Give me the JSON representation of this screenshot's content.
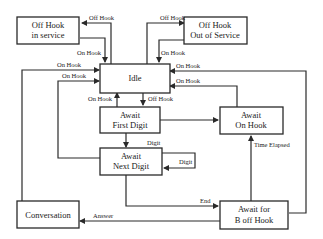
{
  "diagram": {
    "type": "state-machine",
    "states": {
      "off_hook_in_service": {
        "line1": "Off Hook",
        "line2": "in service"
      },
      "off_hook_out_of_service": {
        "line1": "Off Hook",
        "line2": "Out of Service"
      },
      "idle": {
        "line1": "Idle"
      },
      "await_first_digit": {
        "line1": "Await",
        "line2": "First Digit"
      },
      "await_on_hook": {
        "line1": "Await",
        "line2": "On Hook"
      },
      "await_next_digit": {
        "line1": "Await",
        "line2": "Next Digit"
      },
      "conversation": {
        "line1": "Conversation"
      },
      "await_b_off_hook": {
        "line1": "Await for",
        "line2": "B off Hook"
      }
    },
    "transitions": {
      "idle_to_in_service": "Off Hook",
      "in_service_to_idle": "On Hook",
      "idle_to_out_of_service": "Off Hook",
      "out_of_service_to_idle": "On Hook",
      "conversation_to_idle": "On Hook",
      "next_digit_to_idle": "On Hook",
      "b_off_hook_to_idle": "On Hook",
      "await_on_hook_to_idle": "On Hook",
      "first_digit_to_idle": "On Hook",
      "idle_to_first_digit": "Off Hook",
      "first_digit_to_next_digit": "Digit",
      "next_digit_self": "Digit",
      "b_off_hook_to_await_on_hook": "Time Elapsed",
      "next_digit_to_b_off_hook": "End",
      "b_off_hook_to_conversation": "Answer"
    }
  }
}
